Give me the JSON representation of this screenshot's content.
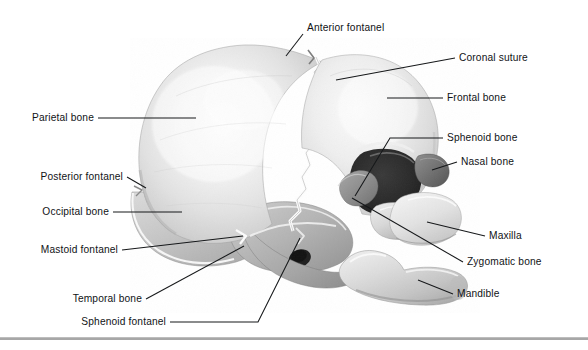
{
  "figure": {
    "width": 588,
    "height": 350,
    "background": "#ffffff",
    "line_color": "#16181a",
    "text_color": "#111316",
    "rule_color": "#a7a7a7"
  },
  "labels": {
    "anterior_fontanel": "Anterior fontanel",
    "coronal_suture": "Coronal suture",
    "frontal_bone": "Frontal bone",
    "sphenoid_bone": "Sphenoid bone",
    "nasal_bone": "Nasal bone",
    "maxilla": "Maxilla",
    "zygomatic_bone": "Zygomatic bone",
    "mandible": "Mandible",
    "parietal_bone": "Parietal bone",
    "posterior_fontanel": "Posterior fontanel",
    "occipital_bone": "Occipital bone",
    "mastoid_fontanel": "Mastoid fontanel",
    "temporal_bone": "Temporal bone",
    "sphenoid_fontanel": "Sphenoid fontanel"
  }
}
